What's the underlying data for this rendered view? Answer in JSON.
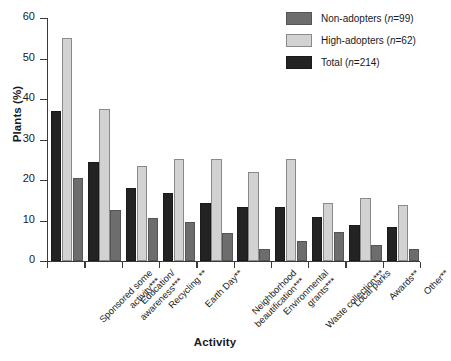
{
  "chart_data": {
    "type": "bar",
    "title": "",
    "xlabel": "Activity",
    "ylabel": "Plants (%)",
    "ylim": [
      0,
      60
    ],
    "yticks": [
      0,
      10,
      20,
      30,
      40,
      50,
      60
    ],
    "grid": false,
    "legend_position": "top-right",
    "categories": [
      "Sponsored some activity***",
      "Education/awareness***",
      "Recycling **",
      "Earth Day**",
      "Neighborhood beautification***",
      "Environmental grants***",
      "Waste collection***",
      "Local parks",
      "Awards**",
      "Other**"
    ],
    "category_lines": [
      [
        "Sponsored some",
        "activity***"
      ],
      [
        "Education/",
        "awareness***"
      ],
      [
        "Recycling **"
      ],
      [
        "Earth Day**"
      ],
      [
        "Neighborhood",
        "beautification***"
      ],
      [
        "Environmental",
        "grants***"
      ],
      [
        "Waste collection***"
      ],
      [
        "Local parks"
      ],
      [
        "Awards**"
      ],
      [
        "Other**"
      ]
    ],
    "series": [
      {
        "name": "Total",
        "key": "total",
        "legend_label": "Total (n=214)",
        "legend_prefix": "Total (",
        "legend_italic": "n",
        "legend_suffix": "=214)",
        "color": "#232323",
        "values": [
          37.0,
          24.3,
          18.0,
          16.8,
          14.3,
          13.3,
          13.3,
          10.7,
          8.7,
          8.3
        ]
      },
      {
        "name": "High-adopters",
        "key": "high",
        "legend_label": "High-adopters (n=62)",
        "legend_prefix": "High-adopters (",
        "legend_italic": "n",
        "legend_suffix": "=62)",
        "color": "#d2d2d2",
        "values": [
          55.0,
          37.5,
          23.3,
          25.0,
          25.0,
          21.8,
          25.0,
          14.3,
          15.5,
          13.8
        ]
      },
      {
        "name": "Non-adopters",
        "key": "non",
        "legend_label": "Non-adopters (n=99)",
        "legend_prefix": "Non-adopters (",
        "legend_italic": "n",
        "legend_suffix": "=99)",
        "color": "#6d6d6d",
        "values": [
          20.5,
          12.5,
          10.5,
          9.5,
          6.8,
          2.8,
          4.8,
          7.0,
          3.8,
          2.8
        ]
      }
    ],
    "bar_order": [
      "total",
      "high",
      "non"
    ]
  },
  "legend": {
    "items": [
      {
        "swatch": "non",
        "label": "Non-adopters (n=99)",
        "prefix": "Non-adopters (",
        "ital": "n",
        "suffix": "=99)"
      },
      {
        "swatch": "high",
        "label": "High-adopters (n=62)",
        "prefix": "High-adopters (",
        "ital": "n",
        "suffix": "=62)"
      },
      {
        "swatch": "total",
        "label": "Total (n=214)",
        "prefix": "Total (",
        "ital": "n",
        "suffix": "=214)"
      }
    ]
  },
  "colors": {
    "total": "#232323",
    "high": "#d2d2d2",
    "non": "#6d6d6d",
    "axis": "#3a3a3a",
    "text": "#1a1a1a",
    "background": "#ffffff"
  }
}
